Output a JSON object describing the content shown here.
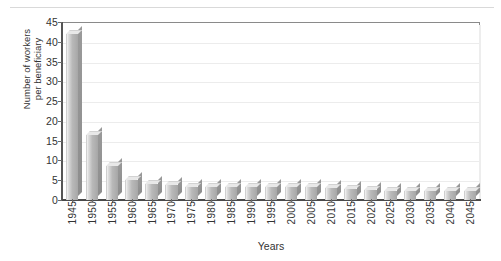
{
  "chart_data": {
    "type": "bar",
    "title": "",
    "xlabel": "Years",
    "ylabel": "Number of workers per beneficiary",
    "ylabel_lines": [
      "Number of workers",
      "per beneficiary"
    ],
    "categories": [
      "1945",
      "1950",
      "1955",
      "1960",
      "1965",
      "1970",
      "1975",
      "1980",
      "1985",
      "1990",
      "1995",
      "2000",
      "2005",
      "2010",
      "2015",
      "2020",
      "2025",
      "2030",
      "2035",
      "2040",
      "2045"
    ],
    "values": [
      41.9,
      16.5,
      8.6,
      5.1,
      4.0,
      3.7,
      3.2,
      3.2,
      3.3,
      3.4,
      3.3,
      3.4,
      3.3,
      3.0,
      2.9,
      2.6,
      2.4,
      2.3,
      2.2,
      2.2,
      2.2
    ],
    "yticks": [
      "0",
      "5",
      "10",
      "15",
      "20",
      "25",
      "30",
      "35",
      "40",
      "45"
    ],
    "ylim": [
      0,
      45
    ],
    "grid": true,
    "legend": "none",
    "series": [
      {
        "name": "Workers per beneficiary",
        "values": [
          41.9,
          16.5,
          8.6,
          5.1,
          4.0,
          3.7,
          3.2,
          3.2,
          3.3,
          3.4,
          3.3,
          3.4,
          3.3,
          3.0,
          2.9,
          2.6,
          2.4,
          2.3,
          2.2,
          2.2,
          2.2
        ]
      }
    ],
    "colors": {
      "bar_face": "#b9b9b9",
      "bar_top": "#e8e8e8",
      "bar_side": "#9a9a9a",
      "grid": "#ececec",
      "axis": "#555555"
    }
  }
}
